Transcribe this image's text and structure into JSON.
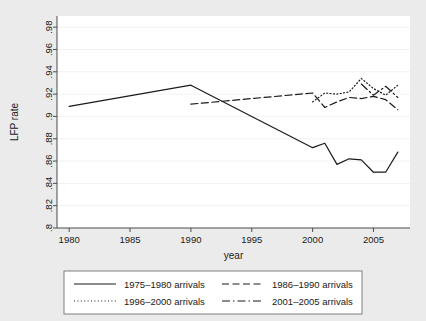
{
  "figure": {
    "background_color": "#ebebeb",
    "plot_background_color": "#ffffff",
    "line_color": "#1a1a1a",
    "grid_color": "#f2f2f2",
    "axis_color": "#4d4d4d"
  },
  "chart_data": {
    "type": "line",
    "title": "",
    "xlabel": "year",
    "ylabel": "LFP rate",
    "xlim": [
      1979,
      2008
    ],
    "ylim": [
      0.8,
      0.99
    ],
    "xticks": [
      1980,
      1985,
      1990,
      1995,
      2000,
      2005
    ],
    "xtick_labels": [
      "1980",
      "1985",
      "1990",
      "1995",
      "2000",
      "2005"
    ],
    "yticks": [
      0.8,
      0.82,
      0.84,
      0.86,
      0.88,
      0.9,
      0.92,
      0.94,
      0.96,
      0.98
    ],
    "ytick_labels": [
      ".8",
      ".82",
      ".84",
      ".86",
      ".88",
      ".9",
      ".92",
      ".94",
      ".96",
      ".98"
    ],
    "grid": true,
    "grid_axis": "y",
    "legend_position": "bottom",
    "legend_columns": 2,
    "series": [
      {
        "name": "1975–1980 arrivals",
        "style": "solid",
        "x": [
          1980,
          1990,
          2000,
          2001,
          2002,
          2003,
          2004,
          2005,
          2006,
          2007
        ],
        "values": [
          0.909,
          0.928,
          0.872,
          0.876,
          0.857,
          0.862,
          0.861,
          0.85,
          0.85,
          0.868
        ]
      },
      {
        "name": "1986–1990 arrivals",
        "style": "dashed",
        "x": [
          1990,
          2000,
          2001,
          2002,
          2003,
          2004,
          2005,
          2006,
          2007
        ],
        "values": [
          0.911,
          0.921,
          0.908,
          0.913,
          0.917,
          0.916,
          0.918,
          0.915,
          0.906
        ]
      },
      {
        "name": "1996–2000 arrivals",
        "style": "dotted",
        "x": [
          2000,
          2001,
          2002,
          2003,
          2004,
          2005,
          2006,
          2007
        ],
        "values": [
          0.913,
          0.921,
          0.92,
          0.922,
          0.934,
          0.925,
          0.919,
          0.928
        ]
      },
      {
        "name": "2001–2005 arrivals",
        "style": "dashdot",
        "x": [
          2004,
          2005,
          2006,
          2007
        ],
        "values": [
          0.929,
          0.919,
          0.927,
          0.917
        ]
      }
    ]
  },
  "legend": {
    "entries": [
      {
        "label": "1975–1980 arrivals",
        "style": "solid"
      },
      {
        "label": "1986–1990 arrivals",
        "style": "dashed"
      },
      {
        "label": "1996–2000 arrivals",
        "style": "dotted"
      },
      {
        "label": "2001–2005 arrivals",
        "style": "dashdot"
      }
    ]
  }
}
